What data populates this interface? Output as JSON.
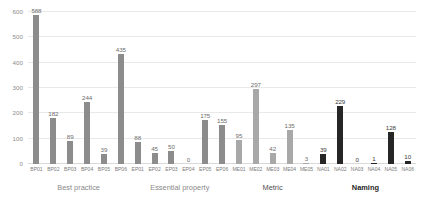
{
  "chart_data": {
    "type": "bar",
    "title": "",
    "xlabel": "",
    "ylabel": "",
    "ylim": [
      0,
      600
    ],
    "grid": true,
    "legend": "none",
    "categories": [
      "BP01",
      "BP02",
      "BP03",
      "BP04",
      "BP05",
      "BP06",
      "EP01",
      "EP02",
      "EP03",
      "EP04",
      "EP05",
      "EP06",
      "ME01",
      "ME02",
      "ME03",
      "ME04",
      "ME05",
      "NA01",
      "NA02",
      "NA03",
      "NA04",
      "NA05",
      "NA06"
    ],
    "values": [
      588,
      182,
      89,
      244,
      39,
      435,
      88,
      45,
      50,
      0,
      175,
      155,
      95,
      297,
      42,
      135,
      3,
      39,
      229,
      0,
      1,
      128,
      10
    ],
    "y_ticks": [
      "0",
      "100",
      "200",
      "300",
      "400",
      "500",
      "600"
    ],
    "y_tick_values": [
      0,
      100,
      200,
      300,
      400,
      500,
      600
    ],
    "bar_shades": [
      "shade-medium",
      "shade-medium",
      "shade-medium",
      "shade-medium",
      "shade-medium",
      "shade-medium",
      "shade-medium",
      "shade-medium",
      "shade-medium",
      "shade-medium",
      "shade-medium",
      "shade-medium",
      "shade-light",
      "shade-light",
      "shade-light",
      "shade-light",
      "shade-light",
      "shade-dark",
      "shade-dark",
      "shade-dark",
      "shade-dark",
      "shade-dark",
      "shade-dark"
    ],
    "groups": [
      {
        "label": "Best practice",
        "start": 0,
        "end": 5,
        "emphasis": "light"
      },
      {
        "label": "Essential property",
        "start": 6,
        "end": 11,
        "emphasis": "light"
      },
      {
        "label": "Metric",
        "start": 12,
        "end": 16,
        "emphasis": "medium"
      },
      {
        "label": "Naming",
        "start": 17,
        "end": 22,
        "emphasis": "strong"
      }
    ],
    "colors": {
      "bar_medium": "#8c8c8c",
      "bar_light": "#a8a8a8",
      "bar_dark": "#262626",
      "gridline": "#e9e9e9",
      "axis": "#d9d9d9",
      "tick_text": "#8d8d8d",
      "value_text": "#6d6d6d",
      "background": "#ffffff"
    }
  }
}
